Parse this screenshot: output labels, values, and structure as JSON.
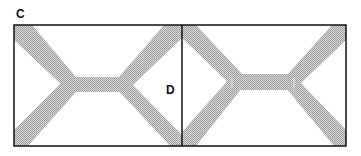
{
  "figure": {
    "labels": {
      "c": "C",
      "d": "D"
    },
    "colors": {
      "frame": "#111111",
      "band": "#bdbdbd",
      "band_center": "#b0b0b0",
      "background": "#ffffff"
    },
    "panels": [
      {
        "name": "left-panel",
        "description": "X-shaped bands joined by horizontal bridge"
      },
      {
        "name": "right-panel",
        "description": "X-shaped bands joined by horizontal bridge with bracketed ends"
      }
    ]
  }
}
